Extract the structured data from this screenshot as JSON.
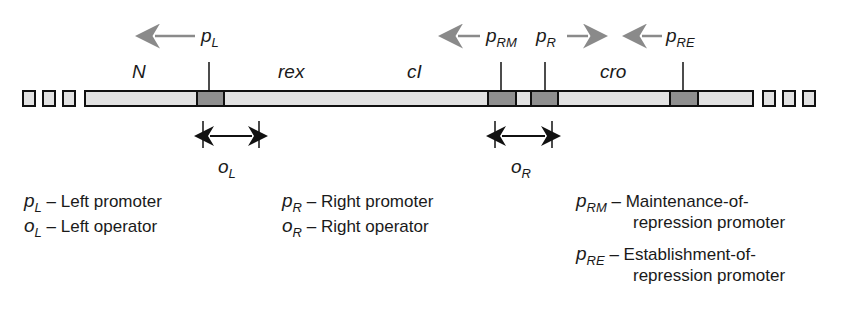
{
  "diagram": {
    "genes": [
      {
        "id": "N",
        "label": "N"
      },
      {
        "id": "rex",
        "label": "rex"
      },
      {
        "id": "cI",
        "label": "cI"
      },
      {
        "id": "cro",
        "label": "cro"
      }
    ],
    "promoters": [
      {
        "id": "pL",
        "base": "p",
        "sub": "L",
        "direction": "left"
      },
      {
        "id": "pRM",
        "base": "p",
        "sub": "RM",
        "direction": "left"
      },
      {
        "id": "pR",
        "base": "p",
        "sub": "R",
        "direction": "right"
      },
      {
        "id": "pRE",
        "base": "p",
        "sub": "RE",
        "direction": "left"
      }
    ],
    "operators": [
      {
        "id": "oL",
        "base": "o",
        "sub": "L"
      },
      {
        "id": "oR",
        "base": "o",
        "sub": "R"
      }
    ],
    "colors": {
      "dna_fill": "#e2e2e2",
      "promoter_fill": "#8f8f8f",
      "outline": "#111111",
      "arrow_gray": "#8a8a8a"
    }
  },
  "legend": [
    {
      "base": "p",
      "sub": "L",
      "text": "– Left promoter"
    },
    {
      "base": "o",
      "sub": "L",
      "text": "– Left operator"
    },
    {
      "base": "p",
      "sub": "R",
      "text": "– Right promoter"
    },
    {
      "base": "o",
      "sub": "R",
      "text": "– Right operator"
    },
    {
      "base": "p",
      "sub": "RM",
      "text": "– Maintenance-of-",
      "text2": "repression promoter"
    },
    {
      "base": "p",
      "sub": "RE",
      "text": "– Establishment-of-",
      "text2": "repression promoter"
    }
  ]
}
